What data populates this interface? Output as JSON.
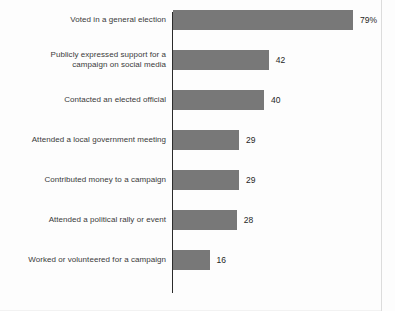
{
  "chart_data": {
    "type": "bar",
    "orientation": "horizontal",
    "title": "",
    "subtitle": "",
    "xlabel": "",
    "ylabel": "",
    "xlim": [
      0,
      79
    ],
    "grid": false,
    "legend": null,
    "bar_color": "#787878",
    "axis_color": "#2b2b2b",
    "label_color": "#3a3a3a",
    "value_color": "#262626",
    "categories": [
      "Voted in a general election",
      "Publicly expressed support for a\ncampaign on social media",
      "Contacted an elected official",
      "Attended a local government meeting",
      "Contributed money to a campaign",
      "Attended a political rally or event",
      "Worked or volunteered for a campaign"
    ],
    "values": [
      79,
      42,
      40,
      29,
      29,
      28,
      16
    ],
    "value_labels": [
      "79%",
      "42",
      "40",
      "29",
      "29",
      "28",
      "16"
    ]
  }
}
